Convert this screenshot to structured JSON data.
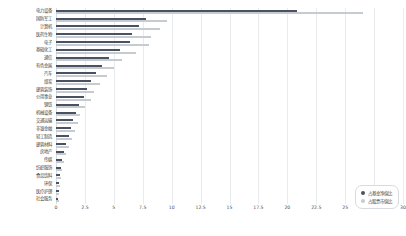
{
  "chart_data": {
    "type": "bar",
    "orientation": "horizontal",
    "title": "",
    "xlabel": "",
    "ylabel": "",
    "xlim": [
      0,
      30
    ],
    "xticks": [
      "0",
      "2.5",
      "5",
      "7.5",
      "10",
      "12.5",
      "15",
      "17.5",
      "20",
      "22.5",
      "25",
      "27.5",
      "30"
    ],
    "grid": true,
    "legend_position": "lower-right",
    "categories": [
      "电力设备",
      "国防军工",
      "计算机",
      "医药生物",
      "电子",
      "基础化工",
      "通信",
      "有色金属",
      "汽车",
      "煤炭",
      "建筑装饰",
      "公用事业",
      "钢铁",
      "机械设备",
      "交通运输",
      "非银金融",
      "轻工制造",
      "建筑材料",
      "房地产",
      "传媒",
      "纺织服饰",
      "食品饮料",
      "环保",
      "医疗护理",
      "社会服务"
    ],
    "series": [
      {
        "name": "占基金净值比",
        "color": "#4a5160",
        "values": [
          20.8,
          7.8,
          7.2,
          6.6,
          6.4,
          5.5,
          4.6,
          4.0,
          3.5,
          3.0,
          2.7,
          2.4,
          2.0,
          1.7,
          1.5,
          1.3,
          1.1,
          0.9,
          0.7,
          0.55,
          0.45,
          0.38,
          0.3,
          0.24,
          0.18
        ]
      },
      {
        "name": "占股票市值比",
        "color": "#c6cbd2",
        "values": [
          26.5,
          9.6,
          9.0,
          8.2,
          8.0,
          6.9,
          5.7,
          5.0,
          4.4,
          3.8,
          3.3,
          3.0,
          2.5,
          2.1,
          1.9,
          1.6,
          1.4,
          1.1,
          0.9,
          0.7,
          0.56,
          0.47,
          0.37,
          0.3,
          0.22
        ]
      }
    ]
  },
  "legend": {
    "items": [
      {
        "label": "占基金净值比",
        "color": "#4a5160"
      },
      {
        "label": "占股票市值比",
        "color": "#c6cbd2"
      }
    ]
  }
}
